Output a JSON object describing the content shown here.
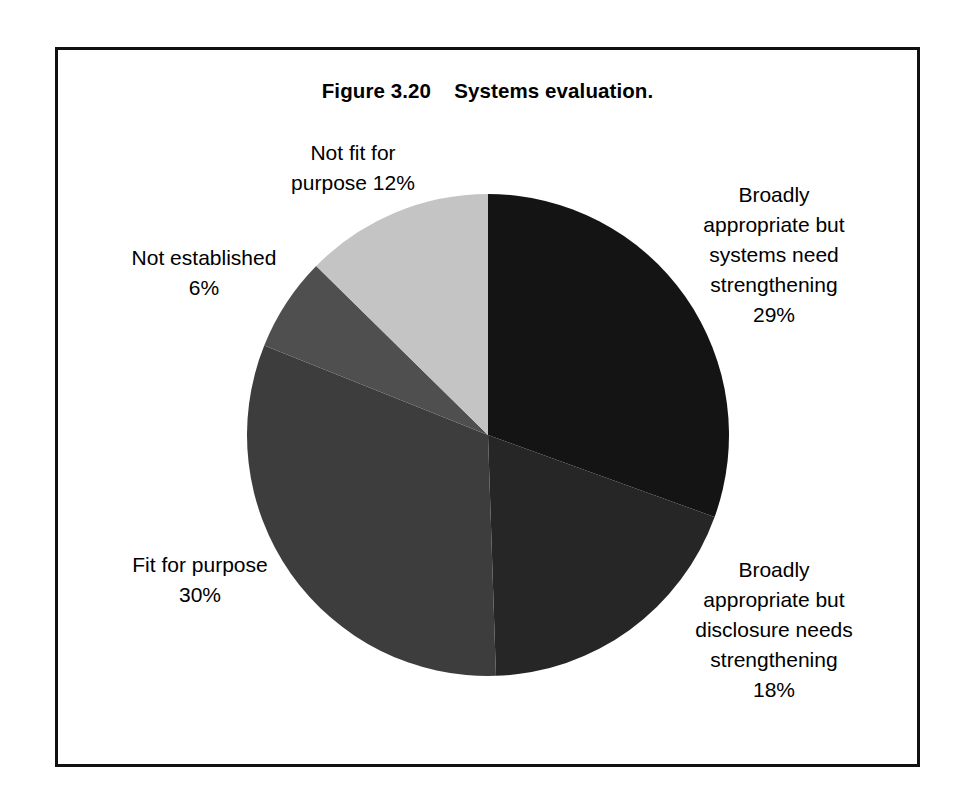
{
  "figure": {
    "title": "Figure 3.20    Systems evaluation.",
    "frame_color": "#111111",
    "background": "#ffffff"
  },
  "chart_data": {
    "type": "pie",
    "title": "Figure 3.20    Systems evaluation.",
    "xlabel": "",
    "ylabel": "",
    "grid": false,
    "legend_position": "none",
    "labels_position": "outside-callout",
    "units": "percent",
    "total": 95,
    "start_angle_deg": 0,
    "direction": "clockwise",
    "categories": [
      "Broadly appropriate but systems need strengthening",
      "Broadly appropriate but disclosure needs strengthening",
      "Fit for purpose",
      "Not established",
      "Not fit for purpose"
    ],
    "values": [
      29,
      18,
      30,
      6,
      12
    ],
    "colors": [
      "#141414",
      "#262626",
      "#3d3d3d",
      "#4f4f4f",
      "#c4c4c4"
    ],
    "slices": [
      {
        "name": "Broadly appropriate but systems need strengthening",
        "value": 29,
        "value_label": "29%",
        "color": "#141414",
        "label_lines": "Broadly\nappropriate but\nsystems need\nstrengthening\n29%"
      },
      {
        "name": "Broadly appropriate but disclosure needs strengthening",
        "value": 18,
        "value_label": "18%",
        "color": "#262626",
        "label_lines": "Broadly\nappropriate but\ndisclosure needs\nstrengthening\n18%"
      },
      {
        "name": "Fit for purpose",
        "value": 30,
        "value_label": "30%",
        "color": "#3d3d3d",
        "label_lines": "Fit for purpose\n30%"
      },
      {
        "name": "Not established",
        "value": 6,
        "value_label": "6%",
        "color": "#4f4f4f",
        "label_lines": "Not established\n6%"
      },
      {
        "name": "Not fit for purpose",
        "value": 12,
        "value_label": "12%",
        "color": "#c4c4c4",
        "label_lines": "Not fit for\npurpose 12%"
      }
    ]
  }
}
